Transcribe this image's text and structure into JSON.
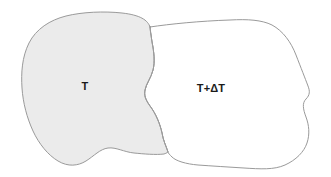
{
  "diagram": {
    "type": "two-adjoining-irregular-regions",
    "background_color": "#ffffff",
    "stroke_color": "#9a9a9a",
    "stroke_width": 1,
    "regions": [
      {
        "id": "left-region",
        "label": "T",
        "fill_color": "#ebebeb",
        "label_x": 85,
        "label_y": 86,
        "description": "gray filled irregular blob on the left"
      },
      {
        "id": "right-region",
        "label": "T+ΔT",
        "fill_color": "#ffffff",
        "label_x": 211,
        "label_y": 88,
        "description": "white unfilled irregular blob on the right"
      }
    ],
    "shared_boundary": {
      "top_junction": [
        150,
        27
      ],
      "bottom_junction": [
        168,
        152
      ]
    },
    "canvas": {
      "width": 331,
      "height": 177
    },
    "paths": {
      "left_region": "M150,27 C148,20 140,15 122,13 C104,11 82,12 66,16 C50,20 36,29 29,43 C22,57 21,73 22,88 C23,103 27,118 33,131 C39,144 48,155 58,161 C68,167 78,166 86,161 C94,156 100,149 108,148 C116,147 124,152 134,153 C144,154 156,155 164,154 C167,153 168,152 168,152 C166,146 163,140 162,133 C160,124 156,114 150,106 C145,99 144,95 145,90 C146,84 151,78 153,70 C155,62 154,52 152,42 C151,35 150,30 150,27 Z",
      "right_region": "M150,27 C170,24 200,21 230,20 C248,19 262,20 272,25 C283,31 291,42 296,55 C301,68 305,78 308,86 C310,91 310,95 306,99 C302,103 303,109 306,117 C309,125 310,134 307,143 C304,152 296,160 285,165 C274,170 260,169 244,168 C228,167 212,166 198,165 C186,164 176,161 172,157 C170,155 168,153 168,152 C166,146 163,140 162,133 C160,124 156,114 150,106 C145,99 144,95 145,90 C146,84 151,78 153,70 C155,62 154,52 152,42 C151,35 150,30 150,27 Z",
      "shared_boundary": "M150,27 C151,35 152,42 152,42 C154,52 155,62 153,70 C151,78 146,84 145,90 C144,95 145,99 150,106 C156,114 160,124 162,133 C163,140 166,146 168,152"
    }
  }
}
